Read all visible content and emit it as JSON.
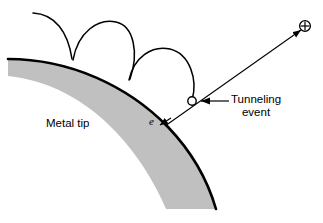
{
  "figure": {
    "width": 323,
    "height": 223,
    "background": "#ffffff",
    "stroke_color": "#000000",
    "tip_fill_color": "#c0c0c0"
  },
  "labels": {
    "metal_tip": "Metal tip",
    "tunneling_line1": "Tunneling",
    "tunneling_line2": "event",
    "electron": "e",
    "ion_symbol": "⊕"
  },
  "annotations": {
    "tunneling_event_marker": "open-circle",
    "electron_direction": "down-left-into-tip",
    "ion_direction": "up-right-away-from-tip"
  },
  "diagram_data": {
    "type": "schematic",
    "subject": "field-emission tunneling at a curved metal tip",
    "elements": [
      {
        "name": "metal-tip",
        "shape": "curved-band",
        "fill": "#c0c0c0"
      },
      {
        "name": "electron-trajectory-loop-1",
        "shape": "arc"
      },
      {
        "name": "electron-trajectory-loop-2",
        "shape": "arc"
      },
      {
        "name": "electron-trajectory-loop-3",
        "shape": "arc"
      },
      {
        "name": "tunneling-event-circle",
        "shape": "open-circle"
      },
      {
        "name": "ion-escape-vector",
        "shape": "arrow"
      },
      {
        "name": "electron-arrow",
        "shape": "arrow"
      },
      {
        "name": "callout-arrow",
        "shape": "arrow"
      }
    ]
  }
}
